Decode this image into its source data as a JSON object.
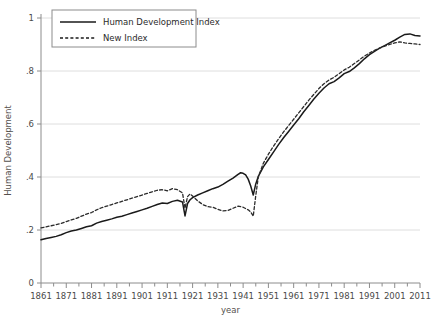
{
  "chart_data": {
    "type": "line",
    "title": "",
    "xlabel": "year",
    "ylabel": "Human Development",
    "xlim": [
      1861,
      2011
    ],
    "ylim": [
      0,
      1
    ],
    "grid": true,
    "grid_axis": "y",
    "legend_position": "top-left",
    "yticks": [
      "0",
      ".2",
      ".4",
      ".6",
      ".8",
      "1"
    ],
    "ytick_values": [
      0,
      0.2,
      0.4,
      0.6,
      0.8,
      1
    ],
    "xticks": [
      "1861",
      "1871",
      "1881",
      "1891",
      "1901",
      "1911",
      "1921",
      "1931",
      "1941",
      "1951",
      "1961",
      "1971",
      "1981",
      "1991",
      "2001",
      "2011"
    ],
    "xtick_values": [
      1861,
      1871,
      1881,
      1891,
      1901,
      1911,
      1921,
      1931,
      1941,
      1951,
      1961,
      1971,
      1981,
      1991,
      2001,
      2011
    ],
    "minor_xtick_step": 5,
    "series": [
      {
        "name": "Human Development Index",
        "style": "solid",
        "color": "#1a1a1a",
        "x": [
          1861,
          1863,
          1865,
          1867,
          1869,
          1871,
          1873,
          1875,
          1877,
          1879,
          1881,
          1883,
          1885,
          1887,
          1889,
          1891,
          1893,
          1895,
          1897,
          1899,
          1901,
          1903,
          1905,
          1907,
          1909,
          1911,
          1913,
          1915,
          1917,
          1918,
          1919,
          1920,
          1921,
          1923,
          1925,
          1927,
          1929,
          1931,
          1933,
          1935,
          1937,
          1939,
          1940,
          1941,
          1942,
          1943,
          1944,
          1945,
          1946,
          1947,
          1949,
          1951,
          1953,
          1955,
          1957,
          1959,
          1961,
          1963,
          1965,
          1967,
          1969,
          1971,
          1973,
          1975,
          1977,
          1979,
          1981,
          1983,
          1985,
          1987,
          1989,
          1991,
          1993,
          1995,
          1997,
          1999,
          2001,
          2003,
          2005,
          2007,
          2009,
          2011
        ],
        "y": [
          0.163,
          0.168,
          0.172,
          0.176,
          0.182,
          0.19,
          0.196,
          0.2,
          0.206,
          0.212,
          0.216,
          0.226,
          0.232,
          0.237,
          0.242,
          0.248,
          0.252,
          0.258,
          0.264,
          0.27,
          0.276,
          0.282,
          0.289,
          0.296,
          0.302,
          0.3,
          0.308,
          0.312,
          0.306,
          0.253,
          0.3,
          0.314,
          0.322,
          0.332,
          0.34,
          0.348,
          0.356,
          0.362,
          0.372,
          0.384,
          0.396,
          0.41,
          0.416,
          0.414,
          0.408,
          0.392,
          0.366,
          0.332,
          0.374,
          0.402,
          0.438,
          0.466,
          0.494,
          0.522,
          0.548,
          0.572,
          0.596,
          0.62,
          0.646,
          0.67,
          0.694,
          0.716,
          0.736,
          0.752,
          0.76,
          0.774,
          0.79,
          0.798,
          0.812,
          0.828,
          0.846,
          0.862,
          0.874,
          0.886,
          0.896,
          0.906,
          0.916,
          0.928,
          0.938,
          0.94,
          0.934,
          0.932
        ]
      },
      {
        "name": "New Index",
        "style": "dashed",
        "color": "#2b2b2b",
        "x": [
          1861,
          1863,
          1865,
          1867,
          1869,
          1871,
          1873,
          1875,
          1877,
          1879,
          1881,
          1883,
          1885,
          1887,
          1889,
          1891,
          1893,
          1895,
          1897,
          1899,
          1901,
          1903,
          1905,
          1907,
          1909,
          1911,
          1913,
          1915,
          1917,
          1918,
          1919,
          1920,
          1921,
          1923,
          1925,
          1927,
          1929,
          1931,
          1933,
          1935,
          1937,
          1939,
          1941,
          1943,
          1944,
          1945,
          1946,
          1947,
          1949,
          1951,
          1953,
          1955,
          1957,
          1959,
          1961,
          1963,
          1965,
          1967,
          1969,
          1971,
          1973,
          1975,
          1977,
          1979,
          1981,
          1983,
          1985,
          1987,
          1989,
          1991,
          1993,
          1995,
          1997,
          1999,
          2001,
          2003,
          2005,
          2007,
          2009,
          2011
        ],
        "y": [
          0.208,
          0.212,
          0.216,
          0.22,
          0.225,
          0.232,
          0.238,
          0.244,
          0.252,
          0.26,
          0.266,
          0.276,
          0.284,
          0.29,
          0.296,
          0.302,
          0.308,
          0.314,
          0.32,
          0.326,
          0.332,
          0.338,
          0.344,
          0.35,
          0.352,
          0.348,
          0.356,
          0.352,
          0.34,
          0.282,
          0.326,
          0.336,
          0.328,
          0.31,
          0.296,
          0.288,
          0.286,
          0.278,
          0.272,
          0.274,
          0.282,
          0.29,
          0.286,
          0.276,
          0.268,
          0.252,
          0.33,
          0.4,
          0.452,
          0.486,
          0.516,
          0.544,
          0.57,
          0.594,
          0.618,
          0.642,
          0.666,
          0.69,
          0.712,
          0.734,
          0.752,
          0.766,
          0.776,
          0.79,
          0.804,
          0.814,
          0.828,
          0.842,
          0.856,
          0.868,
          0.878,
          0.886,
          0.894,
          0.9,
          0.906,
          0.91,
          0.906,
          0.904,
          0.902,
          0.9
        ]
      }
    ]
  },
  "legend": {
    "items": [
      {
        "label": "Human Development Index",
        "style": "solid"
      },
      {
        "label": "New Index",
        "style": "dashed"
      }
    ]
  }
}
